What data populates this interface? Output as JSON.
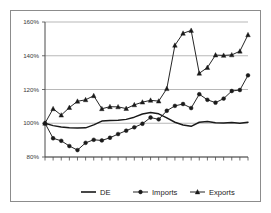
{
  "chart_data": {
    "type": "line",
    "title": "",
    "subtitle": "",
    "xlabel": "",
    "ylabel": "",
    "ylim": [
      80,
      160
    ],
    "yticks": [
      80,
      100,
      120,
      140,
      160
    ],
    "ytick_labels": [
      "80%",
      "100%",
      "120%",
      "140%",
      "160%"
    ],
    "grid": true,
    "grid_axis": "y",
    "xtick_labels": [],
    "n_points": 26,
    "x": [
      1,
      2,
      3,
      4,
      5,
      6,
      7,
      8,
      9,
      10,
      11,
      12,
      13,
      14,
      15,
      16,
      17,
      18,
      19,
      20,
      21,
      22,
      23,
      24,
      25,
      26
    ],
    "legend_position": "bottom",
    "series": [
      {
        "name": "DE",
        "marker": "none",
        "color": "#1a1a1a",
        "values": [
          100.0,
          98.6,
          97.8,
          97.3,
          97.2,
          97.3,
          99.0,
          101.3,
          101.6,
          101.8,
          102.3,
          103.6,
          105.5,
          106.4,
          105.6,
          103.2,
          100.6,
          99.0,
          98.2,
          100.6,
          101.0,
          100.3,
          100.2,
          100.4,
          100.0,
          100.6
        ]
      },
      {
        "name": "Imports",
        "marker": "circle",
        "color": "#1a1a1a",
        "values": [
          100.0,
          91.1,
          89.6,
          86.5,
          84.1,
          88.4,
          90.2,
          89.8,
          91.4,
          93.6,
          95.6,
          97.6,
          99.7,
          103.4,
          102.3,
          107.4,
          110.3,
          111.4,
          109.0,
          117.2,
          113.9,
          112.2,
          114.6,
          119.1,
          119.7,
          128.4
        ]
      },
      {
        "name": "Exports",
        "marker": "triangle",
        "color": "#1a1a1a",
        "values": [
          100.0,
          108.6,
          104.8,
          109.3,
          113.0,
          113.9,
          116.3,
          108.6,
          109.8,
          109.7,
          108.7,
          110.9,
          112.5,
          113.6,
          113.1,
          120.5,
          146.2,
          153.3,
          155.0,
          129.6,
          133.0,
          140.4,
          140.2,
          140.5,
          142.7,
          152.4
        ]
      }
    ]
  },
  "legend": {
    "items": [
      {
        "label": "DE",
        "marker": "none"
      },
      {
        "label": "Imports",
        "marker": "circle"
      },
      {
        "label": "Exports",
        "marker": "triangle"
      }
    ]
  }
}
